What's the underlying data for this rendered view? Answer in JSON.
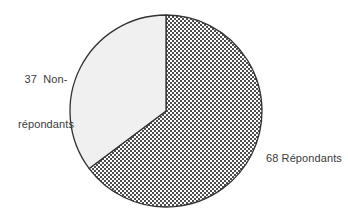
{
  "chart_data": {
    "type": "pie",
    "title": "",
    "subtitle": "",
    "xlabel": "",
    "ylabel": "",
    "legend_position": "none",
    "grid": false,
    "total": 105,
    "categories": [
      "Répondants",
      "Non-répondants"
    ],
    "values": [
      68,
      37
    ],
    "slices": [
      {
        "label": "Répondants",
        "value": 68,
        "percent": 64.8,
        "start_angle_deg": 0,
        "sweep_angle_deg": 233.1,
        "fill": "#8a8a8a",
        "pattern": "checker-dither",
        "annotation": "68 Répondants"
      },
      {
        "label": "Non-répondants",
        "value": 37,
        "percent": 35.2,
        "start_angle_deg": 233.1,
        "sweep_angle_deg": 126.9,
        "fill": "#f0f0f0",
        "pattern": "solid",
        "annotation": "37  Non-\nrépondants"
      }
    ],
    "annotations": [
      {
        "text": "37  Non-",
        "x": 46,
        "y": 52
      },
      {
        "text": "répondants",
        "x": 46,
        "y": 67
      },
      {
        "text": "68 Répondants",
        "x": 266,
        "y": 158
      }
    ],
    "colors": {
      "background": "#ffffff",
      "outline": "#333333",
      "dark_slice": "#8a8a8a",
      "light_slice": "#f0f0f0",
      "label_text": "#3b3b3b"
    }
  },
  "labels": {
    "non_repondants_line1": "37  Non-",
    "non_repondants_line2": "répondants",
    "repondants": "68 Répondants"
  }
}
